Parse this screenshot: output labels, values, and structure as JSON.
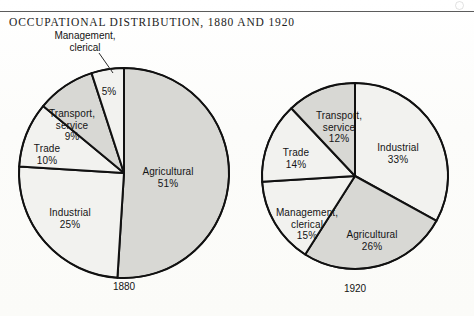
{
  "title": "OCCUPATIONAL DISTRIBUTION, 1880 AND 1920",
  "colors": {
    "shaded": "#d8d8d4",
    "light": "#f2f2ef",
    "outline": "#111111",
    "rule": "#5c5c5c",
    "text": "#141414"
  },
  "callout": {
    "line1": "Management,",
    "line2": "clerical"
  },
  "charts": [
    {
      "year_label": "1880",
      "center": {
        "x": 124,
        "y": 173
      },
      "radius": 105,
      "slices": [
        {
          "name": "Agricultural",
          "pct_label": "51%",
          "value": 51,
          "shade": "shaded",
          "label_x": 168,
          "label_y": 166,
          "show_name": true
        },
        {
          "name": "Industrial",
          "pct_label": "25%",
          "value": 25,
          "shade": "light",
          "label_x": 70,
          "label_y": 207,
          "show_name": true
        },
        {
          "name": "Trade",
          "pct_label": "10%",
          "value": 10,
          "shade": "light",
          "label_x": 47,
          "label_y": 143,
          "show_name": true
        },
        {
          "name": "Transport, service",
          "pct_label": "9%",
          "value": 9,
          "shade": "shaded",
          "label_x": 72,
          "label_y": 108,
          "show_name": true
        },
        {
          "name": "Management, clerical",
          "pct_label": "5%",
          "value": 5,
          "shade": "light",
          "label_x": 109,
          "label_y": 86,
          "show_name": false
        }
      ]
    },
    {
      "year_label": "1920",
      "center": {
        "x": 355,
        "y": 176
      },
      "radius": 93,
      "slices": [
        {
          "name": "Industrial",
          "pct_label": "33%",
          "value": 33,
          "shade": "light",
          "label_x": 398,
          "label_y": 142,
          "show_name": true
        },
        {
          "name": "Agricultural",
          "pct_label": "26%",
          "value": 26,
          "shade": "shaded",
          "label_x": 372,
          "label_y": 229,
          "show_name": true
        },
        {
          "name": "Management, clerical",
          "pct_label": "15%",
          "value": 15,
          "shade": "light",
          "label_x": 307,
          "label_y": 207,
          "show_name": true
        },
        {
          "name": "Trade",
          "pct_label": "14%",
          "value": 14,
          "shade": "light",
          "label_x": 296,
          "label_y": 147,
          "show_name": true
        },
        {
          "name": "Transport, service",
          "pct_label": "12%",
          "value": 12,
          "shade": "shaded",
          "label_x": 339,
          "label_y": 110,
          "show_name": true
        }
      ]
    }
  ],
  "chart_data": {
    "type": "pie",
    "title": "OCCUPATIONAL DISTRIBUTION, 1880 AND 1920",
    "xlabel": "",
    "ylabel": "",
    "legend": "none",
    "units": "percent of workforce",
    "charts": [
      {
        "name": "1880",
        "categories": [
          "Agricultural",
          "Industrial",
          "Trade",
          "Transport, service",
          "Management, clerical"
        ],
        "values": [
          51,
          25,
          10,
          9,
          5
        ]
      },
      {
        "name": "1920",
        "categories": [
          "Industrial",
          "Agricultural",
          "Management, clerical",
          "Trade",
          "Transport, service"
        ],
        "values": [
          33,
          26,
          15,
          14,
          12
        ]
      }
    ]
  }
}
